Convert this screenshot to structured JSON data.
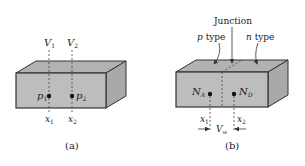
{
  "figure_a": {
    "caption": "(a)",
    "voltage_labels": [
      "V",
      "V"
    ],
    "voltage_subscripts": [
      "1",
      "2"
    ],
    "point_labels": [
      "p",
      "p"
    ],
    "point_subscripts": [
      "1",
      "2"
    ],
    "position_labels": [
      "x",
      "x"
    ],
    "position_subscripts": [
      "1",
      "2"
    ]
  },
  "figure_b": {
    "caption": "(b)",
    "junction_label": "Junction",
    "p_region_label_italic": "p",
    "p_region_label_rest": " type",
    "n_region_label_italic": "n",
    "n_region_label_rest": " type",
    "acceptor_label": "N",
    "acceptor_subscript": "A",
    "donor_label": "N",
    "donor_subscript": "D",
    "position_labels": [
      "x",
      "x"
    ],
    "position_subscripts": [
      "1",
      "2"
    ],
    "width_label": "V",
    "width_subscript": "w"
  },
  "colors": {
    "box_front": "#bdbdbd",
    "box_top": "#b2b2b2",
    "box_side": "#a9a9a9",
    "stroke": "#333333"
  }
}
